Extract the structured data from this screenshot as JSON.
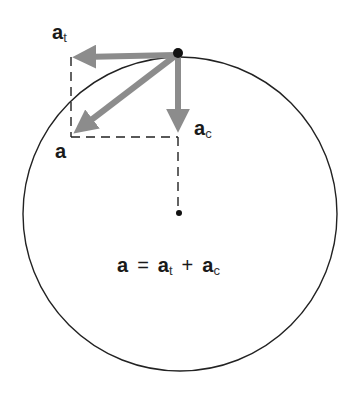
{
  "diagram": {
    "circle": {
      "cx": 180,
      "cy": 214,
      "r": 158,
      "stroke": "#222222"
    },
    "point": {
      "x": 178,
      "y": 53
    },
    "center": {
      "x": 179,
      "y": 213
    },
    "arrow_color": "#8c8c8c",
    "labels": {
      "a_total": {
        "base": "a",
        "sub": ""
      },
      "a_t": {
        "base": "a",
        "sub": "t"
      },
      "a_c": {
        "base": "a",
        "sub": "c"
      }
    },
    "equation": {
      "lhs": "a",
      "equals": "=",
      "term1": "a",
      "term1_sub": "t",
      "plus": "+",
      "term2": "a",
      "term2_sub": "c"
    },
    "vectors": [
      {
        "name": "a_t",
        "from": [
          178,
          53
        ],
        "to": [
          71,
          57
        ]
      },
      {
        "name": "a_c",
        "from": [
          178,
          53
        ],
        "to": [
          178,
          134
        ]
      },
      {
        "name": "a",
        "from": [
          178,
          53
        ],
        "to": [
          73,
          134
        ]
      }
    ]
  }
}
